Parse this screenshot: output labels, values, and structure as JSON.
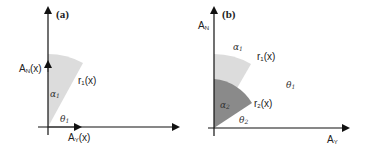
{
  "panel_a": {
    "label": "(a)",
    "y_axis_label_main": "A",
    "y_axis_label_sub": "N",
    "y_axis_label_tail": "(x)",
    "x_axis_label_main": "A",
    "x_axis_label_sub": "Y",
    "x_axis_label_tail": "(x)",
    "radius_label_main": "r",
    "radius_label_sub": "1",
    "radius_label_tail": "(x)",
    "alpha_label": "α",
    "alpha_sub": "1",
    "theta_label": "θ",
    "theta_sub": "1",
    "sector_color": "#dcdcdc"
  },
  "panel_b": {
    "label": "(b)",
    "y_axis_label_main": "A",
    "y_axis_label_sub": "N",
    "x_axis_label_main": "A",
    "x_axis_label_sub": "Y",
    "r1_main": "r",
    "r1_sub": "1",
    "r1_tail": "(x)",
    "r2_main": "r",
    "r2_sub": "2",
    "r2_tail": "(x)",
    "alpha1": "α",
    "alpha1_sub": "1",
    "alpha2": "α",
    "alpha2_sub": "2",
    "theta1": "θ",
    "theta1_sub": "1",
    "theta2": "θ",
    "theta2_sub": "2",
    "outer_sector_color": "#dcdcdc",
    "inner_sector_color": "#8a8a8a"
  }
}
